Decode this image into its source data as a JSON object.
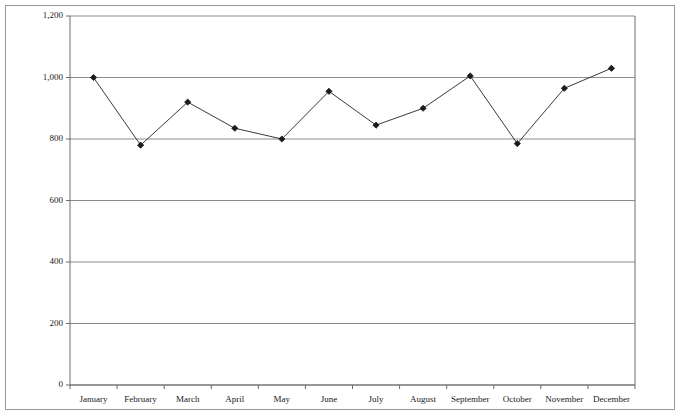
{
  "chart_data": {
    "type": "line",
    "title": "",
    "subtitle": "",
    "xlabel": "",
    "ylabel": "",
    "categories": [
      "January",
      "February",
      "March",
      "April",
      "May",
      "June",
      "July",
      "August",
      "September",
      "October",
      "November",
      "December"
    ],
    "values": [
      1000,
      780,
      920,
      835,
      800,
      955,
      845,
      900,
      1005,
      785,
      965,
      1030
    ],
    "series": [
      {
        "name": "",
        "values": [
          1000,
          780,
          920,
          835,
          800,
          955,
          845,
          900,
          1005,
          785,
          965,
          1030
        ]
      }
    ],
    "ylim": [
      0,
      1200
    ],
    "ytick_values": [
      0,
      200,
      400,
      600,
      800,
      1000,
      1200
    ],
    "ytick_labels": [
      "0",
      "200",
      "400",
      "600",
      "800",
      "1,000",
      "1,200"
    ],
    "xtick_labels": [
      "January",
      "February",
      "March",
      "April",
      "May",
      "June",
      "July",
      "August",
      "September",
      "October",
      "November",
      "December"
    ],
    "grid": true,
    "grid_axis": "y",
    "legend": false,
    "legend_position": "none",
    "annotations": [],
    "marker": "diamond",
    "line_color": "#3a3a3a",
    "marker_color": "#1a1a1a",
    "grid_color": "#8c8c8c",
    "axis_color": "#6b6b6b",
    "frame_color": "#9a9a9a",
    "background_color": "#ffffff"
  }
}
